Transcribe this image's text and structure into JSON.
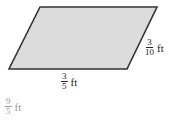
{
  "figure": {
    "shape": "parallelogram",
    "fill": "#dcdcdc",
    "stroke": "#333333",
    "base_label": {
      "numerator": "3",
      "denominator": "5",
      "unit": "ft"
    },
    "side_label": {
      "numerator": "3",
      "denominator": "10",
      "unit": "ft"
    }
  },
  "answer": {
    "numerator": "9",
    "denominator": "5",
    "unit": "ft"
  }
}
